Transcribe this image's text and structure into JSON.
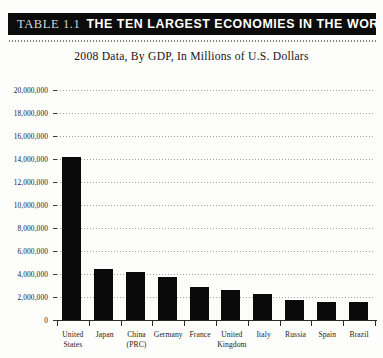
{
  "banner": {
    "table_number": "TABLE 1.1",
    "title": "THE TEN LARGEST ECONOMIES IN THE WORLD",
    "background_color": "#0c0c0c",
    "text_color": "#ffffff"
  },
  "subtitle": "2008 Data, By GDP, In Millions of U.S. Dollars",
  "chart_data": {
    "type": "bar",
    "title": "THE TEN LARGEST ECONOMIES IN THE WORLD",
    "subtitle": "2008 Data, By GDP, In Millions of U.S. Dollars",
    "xlabel": "",
    "ylabel": "",
    "categories": [
      "United States",
      "Japan",
      "China (PRC)",
      "Germany",
      "France",
      "United Kingdom",
      "Italy",
      "Russia",
      "Spain",
      "Brazil"
    ],
    "category_lines": [
      [
        "United",
        "States"
      ],
      [
        "Japan"
      ],
      [
        "China",
        "(PRC)"
      ],
      [
        "Germany"
      ],
      [
        "France"
      ],
      [
        "United",
        "Kingdom"
      ],
      [
        "Italy"
      ],
      [
        "Russia"
      ],
      [
        "Spain"
      ],
      [
        "Brazil"
      ]
    ],
    "values": [
      14200000,
      4400000,
      4200000,
      3700000,
      2850000,
      2650000,
      2300000,
      1700000,
      1600000,
      1600000
    ],
    "ylim": [
      0,
      20000000
    ],
    "ytick_values": [
      0,
      2000000,
      4000000,
      6000000,
      8000000,
      10000000,
      12000000,
      14000000,
      16000000,
      18000000,
      20000000
    ],
    "ytick_labels": [
      "0",
      "2,000,000",
      "4,000,000",
      "6,000,000",
      "8,000,000",
      "10,000,000",
      "12,000,000",
      "14,000,000",
      "16,000,000",
      "18,000,000",
      "20,000,000"
    ],
    "grid": true,
    "grid_style": "dotted",
    "legend": null,
    "bar_color": "#0a0a0a"
  }
}
